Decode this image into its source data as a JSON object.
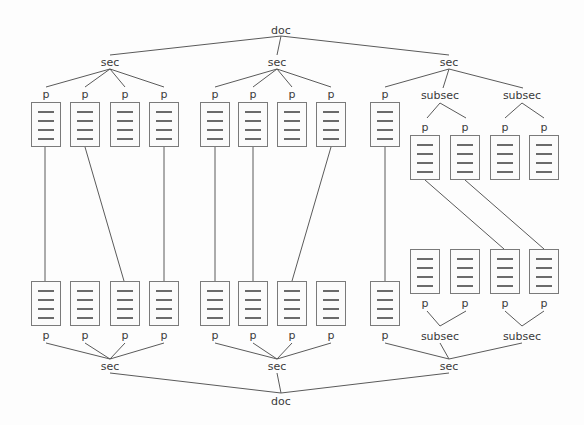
{
  "diagram": {
    "type": "tree-alignment",
    "colors": {
      "line": "#5a5a5a",
      "text": "#3a3a3a",
      "box_border": "#7a7a7a"
    },
    "top_tree": {
      "root": "doc",
      "sections": [
        {
          "label": "sec",
          "children": [
            "p",
            "p",
            "p",
            "p"
          ]
        },
        {
          "label": "sec",
          "children": [
            "p",
            "p",
            "p",
            "p"
          ]
        },
        {
          "label": "sec",
          "children": [
            "p",
            {
              "label": "subsec",
              "children": [
                "p",
                "p"
              ]
            },
            {
              "label": "subsec",
              "children": [
                "p",
                "p"
              ]
            }
          ]
        }
      ]
    },
    "bottom_tree": {
      "root": "doc",
      "sections": [
        {
          "label": "sec",
          "children": [
            "p",
            "p",
            "p",
            "p"
          ]
        },
        {
          "label": "sec",
          "children": [
            "p",
            "p",
            "p",
            "p"
          ]
        },
        {
          "label": "sec",
          "children": [
            "p",
            {
              "label": "subsec",
              "children": [
                "p",
                "p"
              ]
            },
            {
              "label": "subsec",
              "children": [
                "p",
                "p"
              ]
            }
          ]
        }
      ]
    },
    "alignments": [
      {
        "from": "top.sec1.p1",
        "to": "bottom.sec1.p1"
      },
      {
        "from": "top.sec1.p2",
        "to": "bottom.sec1.p3"
      },
      {
        "from": "top.sec1.p4",
        "to": "bottom.sec1.p4"
      },
      {
        "from": "top.sec2.p1",
        "to": "bottom.sec2.p1"
      },
      {
        "from": "top.sec2.p2",
        "to": "bottom.sec2.p2"
      },
      {
        "from": "top.sec2.p4",
        "to": "bottom.sec2.p3"
      },
      {
        "from": "top.sec3.p1",
        "to": "bottom.sec3.p1"
      },
      {
        "from": "top.sec3.subsec1.p1",
        "to": "bottom.sec3.subsec2.p1"
      },
      {
        "from": "top.sec3.subsec1.p2",
        "to": "bottom.sec3.subsec2.p2"
      }
    ]
  },
  "labels": {
    "doc": "doc",
    "sec": "sec",
    "subsec": "subsec",
    "p": "p"
  }
}
